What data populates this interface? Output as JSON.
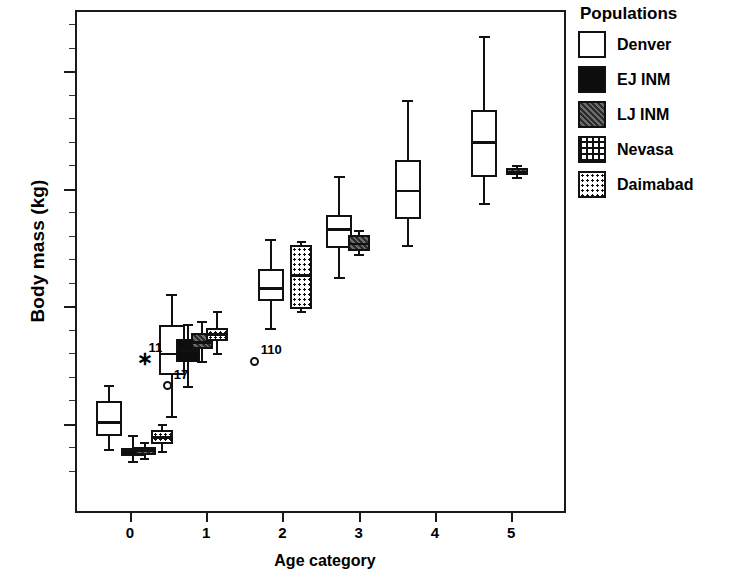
{
  "chart_data": {
    "type": "box",
    "title": "",
    "xlabel": "Age category",
    "ylabel": "Body mass (kg)",
    "xlim": [
      -0.72,
      5.72
    ],
    "ylim": [
      1.2,
      22.6
    ],
    "xticks": [
      "0",
      "1",
      "2",
      "3",
      "4",
      "5"
    ],
    "yticks": [
      "5.0",
      "10.0",
      "15.0",
      "20.0"
    ],
    "grid": false,
    "legend_position": "right",
    "legend_title": "Populations",
    "series": [
      {
        "name": "Denver",
        "fill": "white",
        "boxes": [
          {
            "age": 0,
            "x": -0.3,
            "whisker_low": 3.95,
            "q1": 4.55,
            "median": 5.15,
            "q3": 6.05,
            "whisker_high": 6.7
          },
          {
            "age": 1,
            "x": 0.52,
            "whisker_low": 5.35,
            "q1": 7.15,
            "median": 8.05,
            "q3": 9.3,
            "whisker_high": 10.55
          },
          {
            "age": 2,
            "x": 1.82,
            "whisker_low": 9.1,
            "q1": 10.3,
            "median": 10.85,
            "q3": 11.65,
            "whisker_high": 12.9
          },
          {
            "age": 3,
            "x": 2.72,
            "whisker_low": 11.3,
            "q1": 12.55,
            "median": 13.35,
            "q3": 13.95,
            "whisker_high": 15.6
          },
          {
            "age": 4,
            "x": 3.62,
            "whisker_low": 12.65,
            "q1": 13.8,
            "median": 15.0,
            "q3": 16.3,
            "whisker_high": 18.8
          },
          {
            "age": 5,
            "x": 4.62,
            "whisker_low": 14.45,
            "q1": 15.6,
            "median": 17.05,
            "q3": 18.45,
            "whisker_high": 21.55
          }
        ]
      },
      {
        "name": "EJ INM",
        "fill": "solid-black",
        "boxes": [
          {
            "age": 0,
            "x": 0.02,
            "whisker_low": 3.45,
            "q1": 3.7,
            "median": 3.95,
            "q3": 4.05,
            "whisker_high": 4.55
          },
          {
            "age": 1,
            "x": 0.74,
            "whisker_low": 6.65,
            "q1": 7.7,
            "median": 8.2,
            "q3": 8.7,
            "whisker_high": 9.3
          }
        ]
      },
      {
        "name": "LJ INM",
        "fill": "dark-gray-noise",
        "boxes": [
          {
            "age": 0,
            "x": 0.17,
            "whisker_low": 3.6,
            "q1": 3.75,
            "median": 3.95,
            "q3": 4.1,
            "whisker_high": 4.25
          },
          {
            "age": 1,
            "x": 0.92,
            "whisker_low": 7.7,
            "q1": 8.25,
            "median": 8.55,
            "q3": 8.95,
            "whisker_high": 9.4
          },
          {
            "age": 3,
            "x": 2.98,
            "whisker_low": 12.25,
            "q1": 12.45,
            "median": 12.75,
            "q3": 13.1,
            "whisker_high": 13.3
          },
          {
            "age": 5,
            "x": 5.05,
            "whisker_low": 15.55,
            "q1": 15.65,
            "median": 15.8,
            "q3": 15.95,
            "whisker_high": 16.05
          }
        ]
      },
      {
        "name": "Nevasa",
        "fill": "cross-hatch",
        "boxes": []
      },
      {
        "name": "Daimabad",
        "fill": "dotted",
        "boxes": [
          {
            "age": 0,
            "x": 0.4,
            "whisker_low": 3.9,
            "q1": 4.2,
            "median": 4.5,
            "q3": 4.8,
            "whisker_high": 5.05
          },
          {
            "age": 1,
            "x": 1.12,
            "whisker_low": 8.05,
            "q1": 8.6,
            "median": 8.9,
            "q3": 9.15,
            "whisker_high": 9.85
          },
          {
            "age": 2,
            "x": 2.22,
            "whisker_low": 9.85,
            "q1": 9.95,
            "median": 11.4,
            "q3": 12.7,
            "whisker_high": 12.8
          }
        ]
      }
    ],
    "outliers": [
      {
        "label": "11",
        "marker": "star",
        "x": 0.14,
        "y": 7.85,
        "series": "Denver"
      },
      {
        "label": "17",
        "marker": "circle",
        "x": 0.47,
        "y": 6.7,
        "series": "Denver"
      },
      {
        "label": "110",
        "marker": "circle",
        "x": 1.61,
        "y": 7.75,
        "series": "Denver"
      }
    ]
  },
  "axes": {
    "ylabel": "Body mass (kg)",
    "xlabel": "Age category",
    "ytick_labels": [
      "20.0",
      "15.0",
      "10.0",
      "5.0"
    ],
    "xtick_labels": [
      "0",
      "1",
      "2",
      "3",
      "4",
      "5"
    ]
  },
  "legend": {
    "title": "Populations",
    "items": [
      {
        "label": "Denver",
        "pattern": "white"
      },
      {
        "label": "EJ INM",
        "pattern": "solid-black"
      },
      {
        "label": "LJ INM",
        "pattern": "dark-gray-noise"
      },
      {
        "label": "Nevasa",
        "pattern": "cross-hatch"
      },
      {
        "label": "Daimabad",
        "pattern": "dotted"
      }
    ]
  }
}
